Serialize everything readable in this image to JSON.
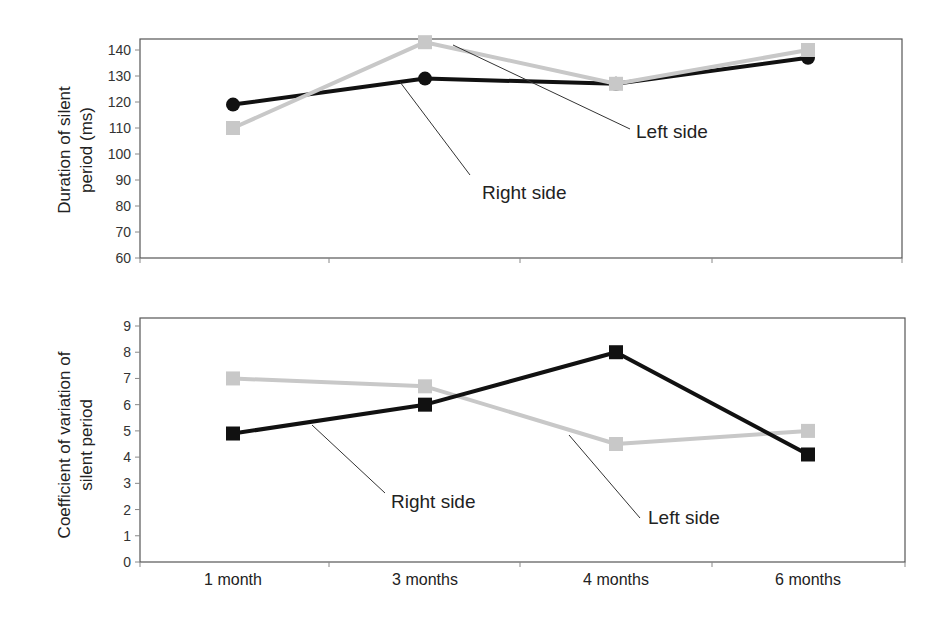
{
  "chart_data": [
    {
      "type": "line",
      "title": "",
      "xlabel": "",
      "ylabel": "Duration of silent period (ms)",
      "ylabel_lines": [
        "Duration of silent",
        "period (ms)"
      ],
      "categories": [
        "1 month",
        "3 months",
        "4 months",
        "6 months"
      ],
      "ylim": [
        60,
        140
      ],
      "yticks": [
        60,
        70,
        80,
        90,
        100,
        110,
        120,
        130,
        140
      ],
      "grid": false,
      "legend": "none (inline annotations)",
      "series": [
        {
          "name": "Right side",
          "color": "#111111",
          "marker": "circle",
          "values": [
            119,
            129,
            127,
            137
          ]
        },
        {
          "name": "Left side",
          "color": "#c8c8c8",
          "marker": "square",
          "values": [
            110,
            143,
            127,
            140
          ]
        }
      ],
      "annotations": [
        {
          "text": "Left side",
          "target_series": "Left side"
        },
        {
          "text": "Right side",
          "target_series": "Right side"
        }
      ]
    },
    {
      "type": "line",
      "title": "",
      "xlabel": "",
      "ylabel": "Coefficient of variation of silent period",
      "ylabel_lines": [
        "Coefficient of variation of",
        "silent period"
      ],
      "categories": [
        "1 month",
        "3 months",
        "4 months",
        "6 months"
      ],
      "ylim": [
        0,
        9
      ],
      "yticks": [
        0,
        1,
        2,
        3,
        4,
        5,
        6,
        7,
        8,
        9
      ],
      "grid": false,
      "legend": "none (inline annotations)",
      "series": [
        {
          "name": "Right side",
          "color": "#111111",
          "marker": "square",
          "values": [
            4.9,
            6.0,
            8.0,
            4.1
          ]
        },
        {
          "name": "Left side",
          "color": "#c8c8c8",
          "marker": "square",
          "values": [
            7.0,
            6.7,
            4.5,
            5.0
          ]
        }
      ],
      "annotations": [
        {
          "text": "Right side",
          "target_series": "Right side"
        },
        {
          "text": "Left side",
          "target_series": "Left side"
        }
      ]
    }
  ]
}
